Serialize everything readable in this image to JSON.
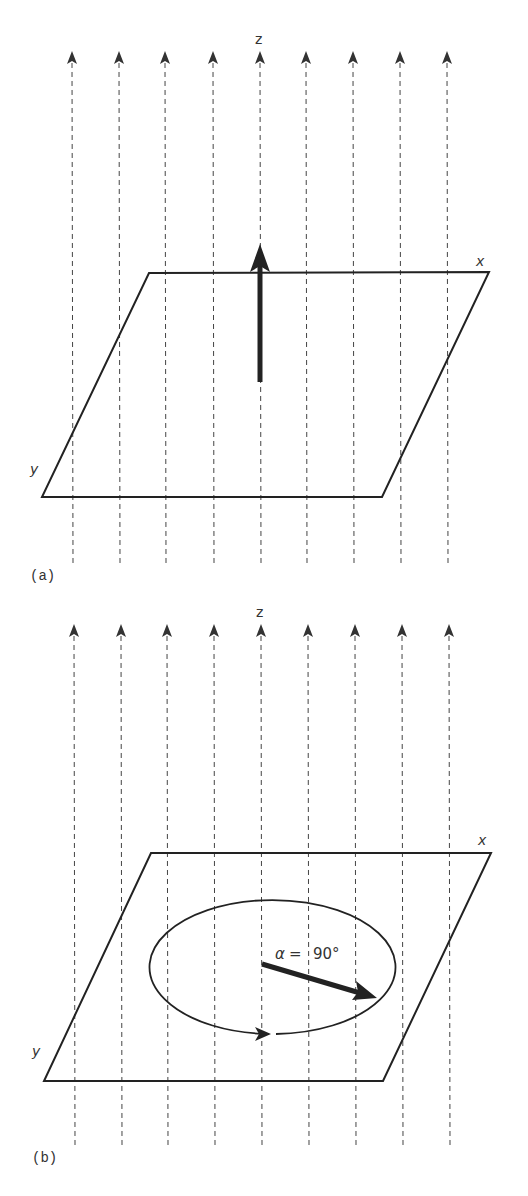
{
  "panels": [
    {
      "id": "a",
      "caption": "(a)",
      "axis_labels": {
        "z": "z",
        "x": "x",
        "y": "y"
      },
      "field_lines_x": [
        72,
        119,
        165,
        213,
        260,
        306,
        353,
        400,
        447
      ],
      "field_top": 57,
      "field_bottom": 563,
      "plane": {
        "tl": [
          149,
          273
        ],
        "tr": [
          489,
          272
        ],
        "br": [
          382,
          497
        ],
        "bl": [
          42,
          497
        ]
      },
      "vector": {
        "from": [
          260,
          382
        ],
        "to": [
          260,
          245
        ],
        "description": "magnetization along z"
      }
    },
    {
      "id": "b",
      "caption": "(b)",
      "axis_labels": {
        "z": "z",
        "x": "x",
        "y": "y"
      },
      "field_lines_x": [
        74,
        121,
        167,
        214,
        261,
        308,
        355,
        402,
        449
      ],
      "field_top": 630,
      "field_bottom": 1145,
      "plane": {
        "tl": [
          151,
          853
        ],
        "tr": [
          491,
          853
        ],
        "br": [
          383,
          1081
        ],
        "bl": [
          44,
          1081
        ]
      },
      "ellipse": {
        "cx": 269,
        "cy": 967,
        "rx": 123,
        "ry": 67
      },
      "vector": {
        "from": [
          262,
          963
        ],
        "to": [
          377,
          998
        ],
        "description": "magnetization tipped into xy plane"
      },
      "angle_label": {
        "symbol": "α",
        "eq": "=",
        "value": "90°"
      }
    }
  ],
  "colors": {
    "line": "#222222",
    "dash": "#444444",
    "text": "#333333"
  }
}
